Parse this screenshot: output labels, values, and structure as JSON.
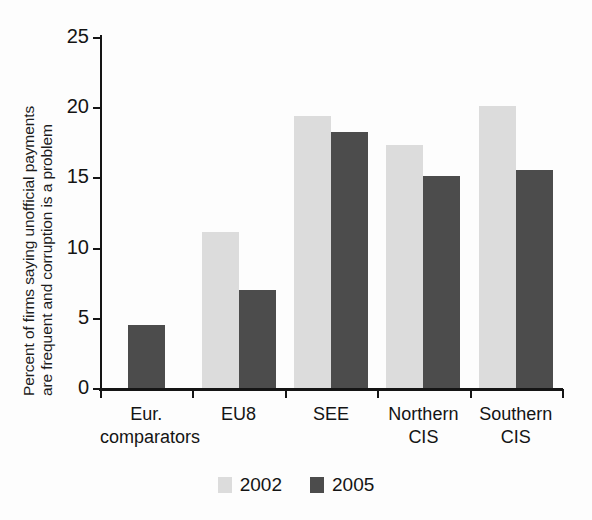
{
  "chart_data": {
    "type": "bar",
    "title": "",
    "subtitle": "",
    "xlabel": "",
    "ylabel_line1": "Percent of firms saying unofficial payments",
    "ylabel_line2": "are frequent and corruption is a problem",
    "ylabel": "Percent of firms saying unofficial payments are frequent and corruption is a problem",
    "categories": [
      "Eur. comparators",
      "EU8",
      "SEE",
      "Northern CIS",
      "Southern CIS"
    ],
    "category_lines": [
      [
        "Eur.",
        "comparators"
      ],
      [
        "EU8",
        ""
      ],
      [
        "SEE",
        ""
      ],
      [
        "Northern",
        "CIS"
      ],
      [
        "Southern",
        "CIS"
      ]
    ],
    "series": [
      {
        "name": "2002",
        "color": "#dcdcdc",
        "values": [
          null,
          11.1,
          19.4,
          17.3,
          20.1
        ]
      },
      {
        "name": "2005",
        "color": "#4c4c4c",
        "values": [
          4.5,
          7.0,
          18.2,
          15.1,
          15.5
        ]
      }
    ],
    "ylim": [
      0,
      25
    ],
    "yticks": [
      0,
      5,
      10,
      15,
      20,
      25
    ],
    "ytick_labels": [
      "0",
      "5",
      "10",
      "15",
      "20",
      "25"
    ],
    "grid": false,
    "legend_position": "bottom-center"
  },
  "legend": {
    "items": [
      {
        "label": "2002",
        "color": "#dcdcdc"
      },
      {
        "label": "2005",
        "color": "#4c4c4c"
      }
    ]
  },
  "colors": {
    "series_2002": "#dcdcdc",
    "series_2005": "#4c4c4c",
    "axis": "#151515",
    "text": "#141414",
    "background": "#fdfdfd"
  }
}
